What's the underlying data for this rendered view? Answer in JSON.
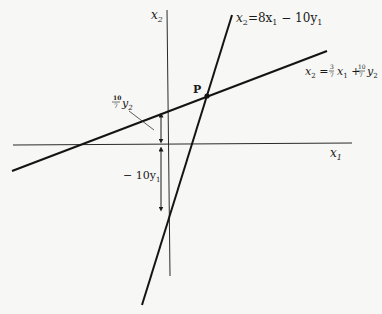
{
  "diagram": {
    "axes": {
      "x_label": "x",
      "x_sub": "1",
      "y_label": "x",
      "y_sub": "2"
    },
    "lines": [
      {
        "id": "steep",
        "eq_lhs": "x",
        "eq_lhs_sub": "2",
        "eq_rhs": "=8x",
        "eq_rhs_sub1": "1",
        "eq_rhs_mid": " − 10y",
        "eq_rhs_sub2": "1",
        "full": "x2 = 8x1 − 10y1"
      },
      {
        "id": "shallow",
        "full": "x2 = 3/7 x1 + 10/7 y2",
        "lhs": "x",
        "lhs_sub": "2",
        "frac1_num": "3",
        "frac1_den": "7",
        "mid": "x",
        "mid_sub": "1",
        "plus": "+",
        "frac2_num": "10",
        "frac2_den": "7",
        "tail": "y",
        "tail_sub": "2"
      }
    ],
    "point": {
      "label": "P"
    },
    "annotations": {
      "upper_frac_num": "10",
      "upper_frac_den": "7",
      "upper_var": "y",
      "upper_sub": "2",
      "lower_prefix": "− 10y",
      "lower_sub": "1"
    },
    "colors": {
      "ink": "#141414",
      "paper": "#f7f7f5"
    }
  }
}
